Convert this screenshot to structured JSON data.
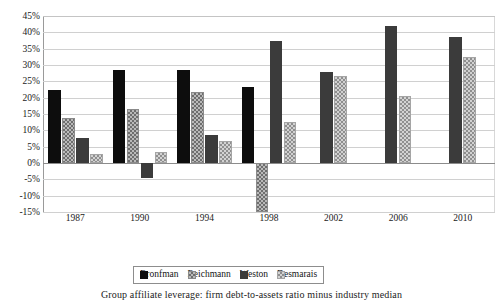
{
  "chart_data": {
    "type": "bar",
    "title": "",
    "xlabel": "",
    "ylabel": "",
    "categories": [
      "1987",
      "1990",
      "1994",
      "1998",
      "2002",
      "2006",
      "2010"
    ],
    "series": [
      {
        "name": "Bronfman",
        "color": "#0d0d0d",
        "pattern": "solid-black",
        "values": [
          22.2,
          28.5,
          28.6,
          23.2,
          null,
          null,
          null
        ]
      },
      {
        "name": "Reichmann",
        "color": "#b9b9b9",
        "pattern": "checker-dark",
        "values": [
          13.7,
          16.5,
          21.6,
          -15.0,
          null,
          null,
          null
        ]
      },
      {
        "name": "Weston",
        "color": "#3b3b3b",
        "pattern": "solid-dark-grey",
        "values": [
          7.7,
          -4.7,
          8.6,
          37.2,
          27.9,
          42.0,
          38.5
        ]
      },
      {
        "name": "Desmarais",
        "color": "#d2d2d2",
        "pattern": "checker-light",
        "values": [
          2.8,
          3.3,
          6.8,
          12.4,
          26.5,
          20.4,
          32.5
        ]
      }
    ],
    "ylim": [
      -15,
      45
    ],
    "ytick_step": 5,
    "ytick_labels": [
      "45%",
      "40%",
      "35%",
      "30%",
      "25%",
      "20%",
      "15%",
      "10%",
      "5%",
      "0%",
      "-5%",
      "-10%",
      "-15%"
    ],
    "ytick_values": [
      45,
      40,
      35,
      30,
      25,
      20,
      15,
      10,
      5,
      0,
      -5,
      -10,
      -15
    ],
    "grid": true,
    "grid_axis": "y",
    "legend_position": "bottom-center",
    "value_unit": "percent"
  },
  "legend": {
    "items": [
      {
        "label": "Bronfman"
      },
      {
        "label": "Reichmann"
      },
      {
        "label": "Weston"
      },
      {
        "label": "Desmarais"
      }
    ]
  },
  "caption": {
    "text": "Group affiliate leverage: firm debt-to-assets ratio minus industry median"
  }
}
